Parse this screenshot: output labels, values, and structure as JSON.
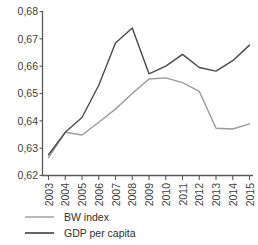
{
  "chart_data": {
    "type": "line",
    "title": "",
    "xlabel": "",
    "ylabel": "",
    "categories": [
      "2003",
      "2004",
      "2005",
      "2006",
      "2007",
      "2008",
      "2009",
      "2010",
      "2011",
      "2012",
      "2013",
      "2014",
      "2015"
    ],
    "x": [
      2003,
      2004,
      2005,
      2006,
      2007,
      2008,
      2009,
      2010,
      2011,
      2012,
      2013,
      2014,
      2015
    ],
    "ylim": [
      0.62,
      0.68
    ],
    "ytick_labels": [
      "0,68",
      "0,67",
      "0,66",
      "0,65",
      "0,64",
      "0,63",
      "0,62"
    ],
    "ytick_values": [
      0.68,
      0.67,
      0.66,
      0.65,
      0.64,
      0.63,
      0.62
    ],
    "grid": false,
    "legend_position": "bottom-left",
    "series": [
      {
        "name": "BW index",
        "color": "#9a9a9a",
        "values": [
          0.6265,
          0.6358,
          0.6348,
          0.6395,
          0.6443,
          0.65,
          0.6553,
          0.6557,
          0.654,
          0.6508,
          0.6373,
          0.637,
          0.6389
        ]
      },
      {
        "name": "GDP per capita",
        "color": "#4a4a4a",
        "values": [
          0.6276,
          0.6358,
          0.6412,
          0.653,
          0.6685,
          0.674,
          0.6572,
          0.66,
          0.6643,
          0.6595,
          0.6582,
          0.662,
          0.6677
        ]
      }
    ]
  },
  "legend": {
    "items": [
      {
        "label": "BW index",
        "color": "#9a9a9a"
      },
      {
        "label": "GDP per capita",
        "color": "#4a4a4a"
      }
    ]
  },
  "axes": {
    "y_ticks": [
      "0,68",
      "0,67",
      "0,66",
      "0,65",
      "0,64",
      "0,63",
      "0,62"
    ],
    "x_ticks": [
      "2003",
      "2004",
      "2005",
      "2006",
      "2007",
      "2008",
      "2009",
      "2010",
      "2011",
      "2012",
      "2013",
      "2014",
      "2015"
    ]
  },
  "caption": {
    "text": ""
  }
}
